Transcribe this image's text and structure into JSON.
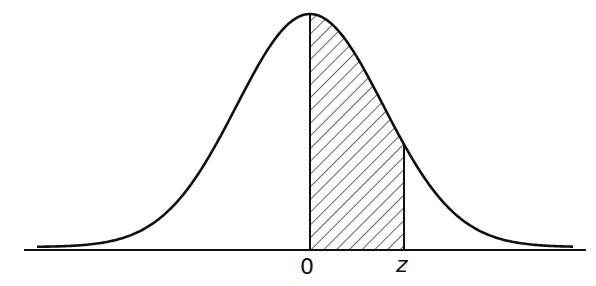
{
  "diagram": {
    "type": "normal-distribution",
    "labels": {
      "mean": "0",
      "z": "z"
    },
    "shaded_region": {
      "from": "0",
      "to": "z",
      "pattern": "diagonal-hatch"
    },
    "colors": {
      "stroke": "#111111",
      "background": "#ffffff"
    }
  }
}
